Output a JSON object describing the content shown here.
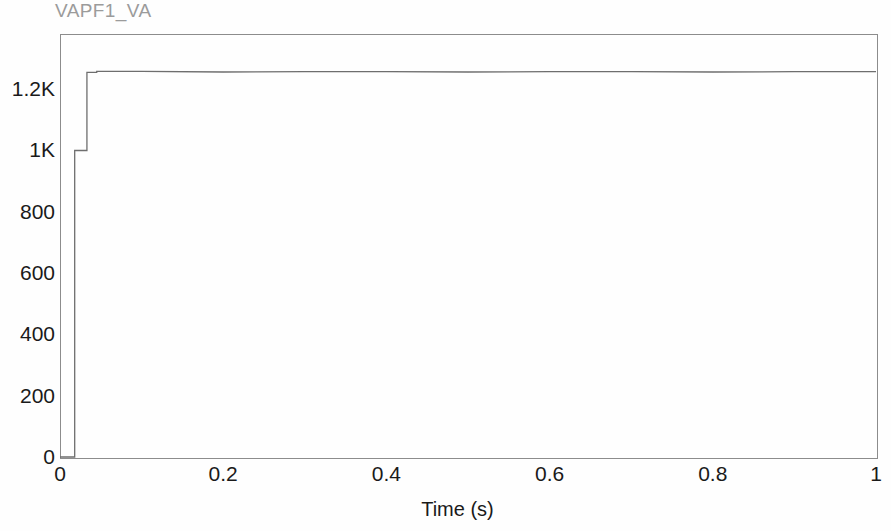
{
  "chart_data": {
    "type": "line",
    "title": "VAPF1_VA",
    "xlabel": "Time (s)",
    "ylabel": "",
    "xlim": [
      0,
      1
    ],
    "ylim": [
      0,
      1380
    ],
    "grid": false,
    "legend": null,
    "xticks": [
      {
        "value": 0,
        "label": "0"
      },
      {
        "value": 0.2,
        "label": "0.2"
      },
      {
        "value": 0.4,
        "label": "0.4"
      },
      {
        "value": 0.6,
        "label": "0.6"
      },
      {
        "value": 0.8,
        "label": "0.8"
      },
      {
        "value": 1,
        "label": "1"
      }
    ],
    "yticks": [
      {
        "value": 0,
        "label": "0"
      },
      {
        "value": 200,
        "label": "200"
      },
      {
        "value": 400,
        "label": "400"
      },
      {
        "value": 600,
        "label": "600"
      },
      {
        "value": 800,
        "label": "800"
      },
      {
        "value": 1000,
        "label": "1K"
      },
      {
        "value": 1200,
        "label": "1.2K"
      }
    ],
    "series": [
      {
        "name": "VAPF1_VA",
        "color": "#6e6e6e",
        "x": [
          0,
          0.018,
          0.018,
          0.033,
          0.033,
          0.045,
          0.045,
          0.1,
          0.2,
          0.3,
          0.4,
          0.5,
          0.6,
          0.7,
          0.8,
          0.9,
          1.0
        ],
        "y": [
          0,
          0,
          1000,
          1000,
          1255,
          1255,
          1258,
          1258,
          1256,
          1257,
          1257,
          1256,
          1257,
          1257,
          1256,
          1257,
          1257
        ]
      }
    ],
    "annotations": [
      {
        "text": "step from 0 to ~1000 V at t = 0.018 s"
      },
      {
        "text": "step from ~1000 to ~1255 V at t = 0.033 s"
      },
      {
        "text": "steady state ~1257 V through t = 1 s"
      }
    ]
  },
  "axis_colors": {
    "frame": "#8c8c8c",
    "trace": "#6e6e6e",
    "tick_text": "#1a1a1a",
    "title_text": "#9b9b9b",
    "background": "#fefefe"
  }
}
